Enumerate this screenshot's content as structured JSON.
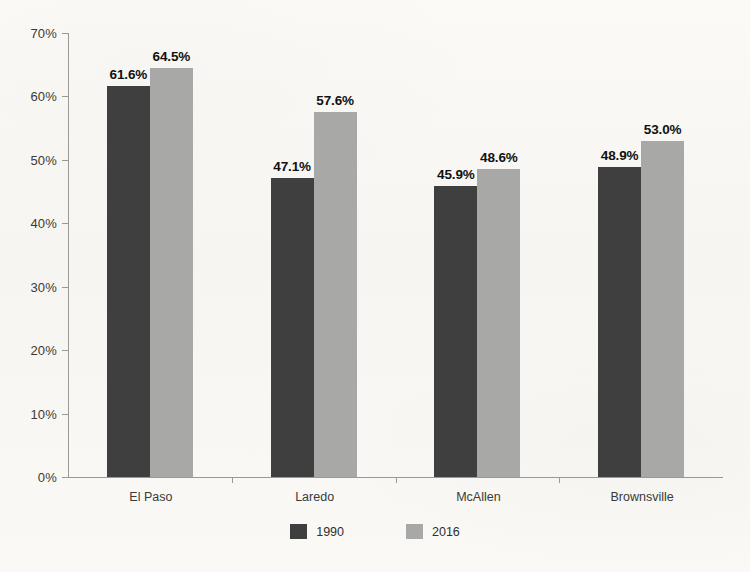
{
  "chart_data": {
    "type": "bar",
    "title": "",
    "xlabel": "",
    "ylabel": "",
    "categories": [
      "El Paso",
      "Laredo",
      "McAllen",
      "Brownsville"
    ],
    "series": [
      {
        "name": "1990",
        "color": "#3f3f3f",
        "values": [
          61.6,
          47.1,
          45.9,
          48.9
        ],
        "labels": [
          "61.6%",
          "47.1%",
          "45.9%",
          "48.9%"
        ]
      },
      {
        "name": "2016",
        "color": "#a8a8a6",
        "values": [
          64.5,
          57.6,
          48.6,
          53.0
        ],
        "labels": [
          "64.5%",
          "57.6%",
          "48.6%",
          "53.0%"
        ]
      }
    ],
    "ylim": [
      0,
      70
    ],
    "ytick_step": 10,
    "ytick_labels": [
      "0%",
      "10%",
      "20%",
      "30%",
      "40%",
      "50%",
      "60%",
      "70%"
    ],
    "ytick_values": [
      0,
      10,
      20,
      30,
      40,
      50,
      60,
      70
    ],
    "grid": false,
    "legend_position": "bottom",
    "value_labels": true,
    "axis_color": "#9a9a95",
    "background_color": "#faf9f6"
  }
}
